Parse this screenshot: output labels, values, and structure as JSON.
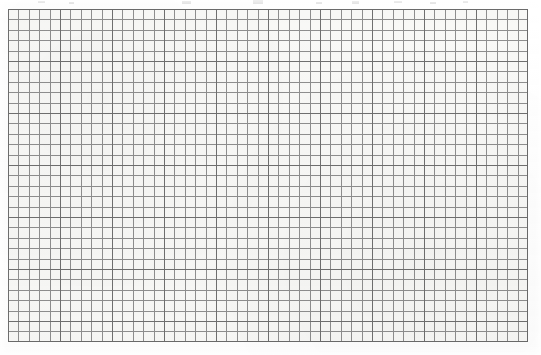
{
  "document": {
    "kind": "scanned-grid-paper",
    "title": "",
    "caption": "",
    "page_width": 541,
    "page_height": 355,
    "page_background": "#ffffff"
  },
  "grid": {
    "name": "graph-paper-grid",
    "left": 8,
    "top": 9,
    "width": 520,
    "height": 333,
    "paper_color": "#f8f8f6",
    "minor_line_color": "#8e8e8e",
    "major_line_color": "#6f6f6f",
    "border_color": "#6a6a6a",
    "minor_cell_px": 10.4,
    "major_cell_px": 52.0,
    "minor_per_major": 5,
    "minor_columns": 50,
    "minor_rows": 32,
    "major_columns": 10,
    "major_rows": 6,
    "offset_x": 0,
    "offset_y": 0
  },
  "artifacts": {
    "name": "scan-smudges",
    "description": "faint gray marks along the top edge of the scan",
    "marks": [
      {
        "left": 38,
        "top": 1,
        "width": 7,
        "height": 2
      },
      {
        "left": 69,
        "top": 2,
        "width": 5,
        "height": 2
      },
      {
        "left": 182,
        "top": 1,
        "width": 9,
        "height": 3
      },
      {
        "left": 253,
        "top": 0,
        "width": 10,
        "height": 4
      },
      {
        "left": 316,
        "top": 2,
        "width": 6,
        "height": 2
      },
      {
        "left": 352,
        "top": 1,
        "width": 7,
        "height": 3
      },
      {
        "left": 394,
        "top": 1,
        "width": 8,
        "height": 2
      },
      {
        "left": 430,
        "top": 2,
        "width": 6,
        "height": 2
      },
      {
        "left": 463,
        "top": 1,
        "width": 5,
        "height": 2
      }
    ]
  },
  "chart_data": {
    "type": "table",
    "title": "",
    "subtitle": "",
    "xlabel": "",
    "ylabel": "",
    "categories": [],
    "values": [],
    "series": [],
    "annotations": [],
    "legend": [],
    "grid": true,
    "note": "Blank graph paper: ruled grid only, no plotted data, no tick labels, no legend."
  }
}
